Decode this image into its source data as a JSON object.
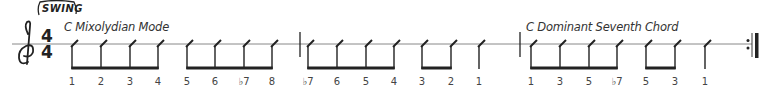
{
  "style_marking": "SWING",
  "time_signature": {
    "top": "4",
    "bottom": "4"
  },
  "sections": [
    {
      "title": "C Mixolydian Mode",
      "x": 64
    },
    {
      "title": "C Dominant Seventh Chord",
      "x": 526
    }
  ],
  "colors": {
    "ink": "#222222",
    "staff": "#888888",
    "text": "#444444"
  },
  "notes": [
    {
      "x": 72,
      "degree": "1",
      "group": 0
    },
    {
      "x": 101,
      "degree": "2",
      "group": 0
    },
    {
      "x": 130,
      "degree": "3",
      "group": 0
    },
    {
      "x": 158,
      "degree": "4",
      "group": 0
    },
    {
      "x": 187,
      "degree": "5",
      "group": 1
    },
    {
      "x": 215,
      "degree": "6",
      "group": 1
    },
    {
      "x": 244,
      "degree": "♭7",
      "group": 1
    },
    {
      "x": 272,
      "degree": "8",
      "group": 1
    },
    {
      "x": 308,
      "degree": "♭7",
      "group": 2
    },
    {
      "x": 337,
      "degree": "6",
      "group": 2
    },
    {
      "x": 366,
      "degree": "5",
      "group": 2
    },
    {
      "x": 394,
      "degree": "4",
      "group": 2
    },
    {
      "x": 422,
      "degree": "3",
      "group": 3
    },
    {
      "x": 451,
      "degree": "2",
      "group": 3
    },
    {
      "x": 479,
      "degree": "1",
      "group": null
    },
    {
      "x": 531,
      "degree": "1",
      "group": 4
    },
    {
      "x": 560,
      "degree": "3",
      "group": 4
    },
    {
      "x": 589,
      "degree": "5",
      "group": 4
    },
    {
      "x": 617,
      "degree": "♭7",
      "group": 4
    },
    {
      "x": 646,
      "degree": "5",
      "group": 5
    },
    {
      "x": 675,
      "degree": "3",
      "group": 5
    },
    {
      "x": 705,
      "degree": "1",
      "group": null
    }
  ],
  "barlines": [
    300,
    520
  ],
  "final_barline": {
    "type": "repeat-end",
    "x": 752
  }
}
